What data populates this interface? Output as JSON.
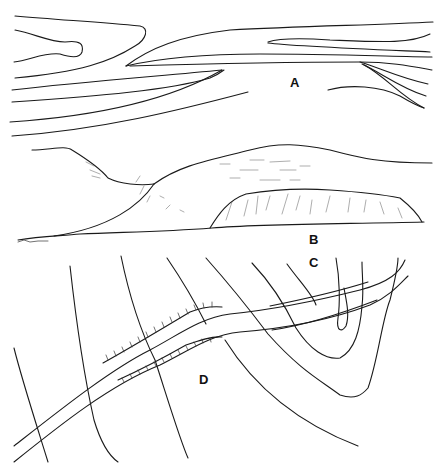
{
  "figure": {
    "caption_fragment": "",
    "panels": [
      {
        "id": "A",
        "label": "A",
        "description": "Plan-view contour lines showing a ridge/valley pattern"
      },
      {
        "id": "B",
        "label": "B",
        "description": "Profile sketch of hills with a steep-sided flat-topped landform"
      },
      {
        "id": "C",
        "label": "C",
        "description": "Contour lines forming a valley (V-shaped)"
      },
      {
        "id": "D",
        "label": "D",
        "description": "Road/railway cutting through contours with hachured embankments"
      }
    ]
  },
  "colors": {
    "background": "#ffffff",
    "line": "#1a1a1a"
  }
}
